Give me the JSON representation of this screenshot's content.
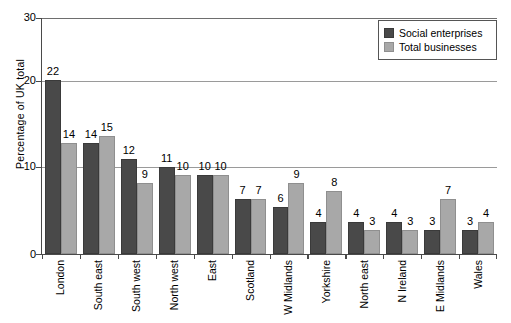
{
  "chart_data": {
    "type": "bar",
    "title": "",
    "xlabel": "",
    "ylabel": "Percentage of UK total",
    "ylim": [
      0,
      30
    ],
    "yticks": [
      0,
      10,
      20,
      30
    ],
    "grid": true,
    "legend_position": "top-right",
    "categories": [
      "London",
      "South east",
      "South west",
      "North west",
      "East",
      "Scotland",
      "W Midlands",
      "Yorkshire",
      "North east",
      "N Ireland",
      "E Midlands",
      "Wales"
    ],
    "series": [
      {
        "name": "Social enterprises",
        "color": "#494949",
        "values": [
          22,
          14,
          12,
          11,
          10,
          7,
          6,
          4,
          4,
          4,
          3,
          3
        ]
      },
      {
        "name": "Total businesses",
        "color": "#a8a8a8",
        "values": [
          14,
          15,
          9,
          10,
          10,
          7,
          9,
          8,
          3,
          3,
          7,
          4
        ]
      }
    ]
  },
  "axis": {
    "y_title": "Percentage of UK total",
    "y_tick_labels": [
      "30",
      "20",
      "10",
      "0"
    ]
  },
  "legend": {
    "items": [
      {
        "label": "Social enterprises",
        "swatch": "dark-swatch"
      },
      {
        "label": "Total businesses",
        "swatch": "light-swatch"
      }
    ]
  }
}
